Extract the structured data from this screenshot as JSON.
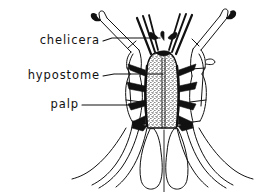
{
  "figure": {
    "kind": "scientific-line-drawing",
    "background_color": "#ffffff",
    "ink_color": "#111111",
    "width": 262,
    "height": 192
  },
  "labels": [
    {
      "id": "chelicera",
      "text": "chelicera",
      "text_x": 100,
      "text_y": 44,
      "leader": "M103,41 L112,38 L160,38",
      "points_to": "chelicerae shafts, upper centre"
    },
    {
      "id": "hypostome",
      "text": "hypostome",
      "text_x": 100,
      "text_y": 79,
      "leader": "M103,76 L114,74 L163,74",
      "points_to": "stippled median hypostome"
    },
    {
      "id": "palp",
      "text": "palp",
      "text_x": 79,
      "text_y": 108,
      "leader": "M82,105 L131,105",
      "points_to": "left palp second segment"
    }
  ],
  "anatomy": {
    "parts": [
      "left palp",
      "right palp",
      "left chelicera",
      "right chelicera",
      "hypostome",
      "basis capituli",
      "porose areas"
    ]
  },
  "stipple": {
    "note": "dense dot texture on hypostome",
    "dot_color": "#111111",
    "count": 430
  }
}
